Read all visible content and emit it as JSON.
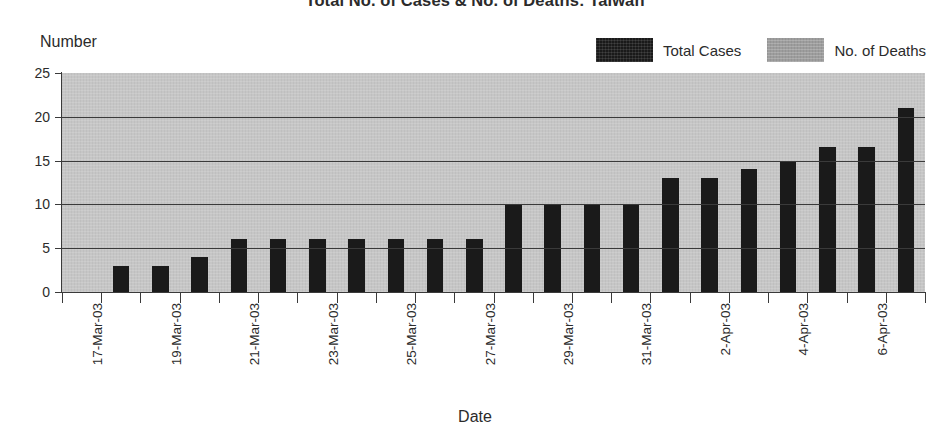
{
  "chart_data": {
    "type": "bar",
    "title": "Total No. of Cases & No. of Deaths: Taiwan",
    "xlabel": "Date",
    "ylabel": "Number",
    "ylim": [
      0,
      25
    ],
    "yticks": [
      0,
      5,
      10,
      15,
      20,
      25
    ],
    "grid": true,
    "legend_position": "top-right",
    "categories": [
      "17-Mar-03",
      "18-Mar-03",
      "19-Mar-03",
      "20-Mar-03",
      "21-Mar-03",
      "22-Mar-03",
      "23-Mar-03",
      "24-Mar-03",
      "25-Mar-03",
      "26-Mar-03",
      "27-Mar-03",
      "28-Mar-03",
      "29-Mar-03",
      "30-Mar-03",
      "31-Mar-03",
      "1-Apr-03",
      "2-Apr-03",
      "3-Apr-03",
      "4-Apr-03",
      "5-Apr-03",
      "6-Apr-03",
      "7-Apr-03"
    ],
    "tick_labels": [
      "17-Mar-03",
      "",
      "19-Mar-03",
      "",
      "21-Mar-03",
      "",
      "23-Mar-03",
      "",
      "25-Mar-03",
      "",
      "27-Mar-03",
      "",
      "29-Mar-03",
      "",
      "31-Mar-03",
      "",
      "2-Apr-03",
      "",
      "4-Apr-03",
      "",
      "6-Apr-03",
      ""
    ],
    "series": [
      {
        "name": "Total Cases",
        "color": "#1a1a1a",
        "values": [
          0,
          3,
          3,
          4,
          6,
          6,
          6,
          6,
          6,
          6,
          6,
          10,
          10,
          10,
          10,
          13,
          13,
          14,
          15,
          16.5,
          16.5,
          21
        ]
      },
      {
        "name": "No. of Deaths",
        "color": "#9d9d9d",
        "values": [
          0,
          0,
          0,
          0,
          0,
          0,
          0,
          0,
          0,
          0,
          0,
          0,
          0,
          0,
          0,
          0,
          0,
          0,
          0,
          0,
          0,
          0
        ]
      }
    ]
  },
  "legend": {
    "items": [
      {
        "label": "Total Cases",
        "swatch": "cases"
      },
      {
        "label": "No. of Deaths",
        "swatch": "deaths"
      }
    ]
  }
}
